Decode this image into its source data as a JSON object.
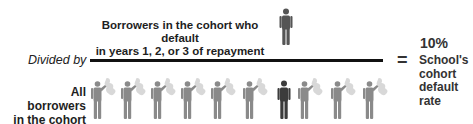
{
  "numerator": {
    "line1": "Borrowers in the cohort who default",
    "line2": "in years 1, 2, or 3 of repayment"
  },
  "divider_label": "Divided by",
  "equals_sign": "=",
  "result": {
    "value": "10%",
    "label_lines": [
      "School's",
      "cohort",
      "default",
      "rate"
    ]
  },
  "denominator": {
    "line1": "All borrowers",
    "line2": "in the cohort"
  },
  "figures": {
    "numerator_figure": {
      "style": "default",
      "color": "#555555"
    },
    "cohort": [
      {
        "style": "waving",
        "color": "#8a8a8a"
      },
      {
        "style": "waving",
        "color": "#8a8a8a"
      },
      {
        "style": "waving",
        "color": "#8a8a8a"
      },
      {
        "style": "waving",
        "color": "#8a8a8a"
      },
      {
        "style": "waving",
        "color": "#8a8a8a"
      },
      {
        "style": "waving",
        "color": "#8a8a8a"
      },
      {
        "style": "default",
        "color": "#3c3c3c"
      },
      {
        "style": "waving",
        "color": "#8a8a8a"
      },
      {
        "style": "waving",
        "color": "#8a8a8a"
      },
      {
        "style": "waving",
        "color": "#8a8a8a"
      }
    ]
  },
  "colors": {
    "background": "#ffffff",
    "text": "#222222",
    "bar": "#111111",
    "waving_person": "#8a8a8a",
    "defaulter": "#3c3c3c",
    "ghost": "#d6d6d6"
  }
}
